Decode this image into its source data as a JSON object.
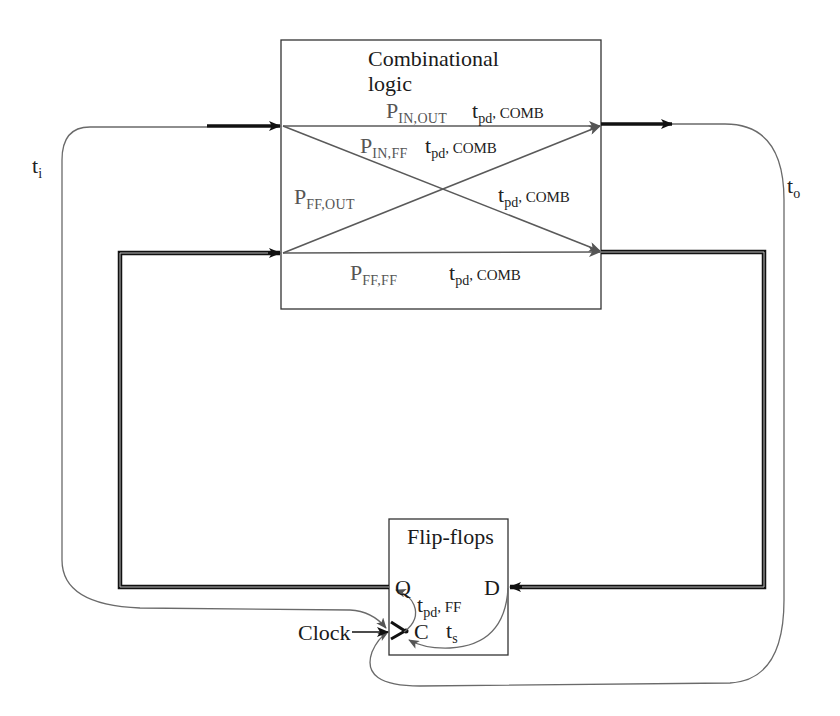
{
  "blocks": {
    "comb": {
      "title_line1": "Combinational",
      "title_line2": "logic"
    },
    "ff": {
      "title": "Flip-flops",
      "pin_q": "Q",
      "pin_d": "D",
      "pin_c": "C"
    }
  },
  "paths": {
    "in_out": {
      "p": "P",
      "p_sub": "IN,OUT",
      "t": "t",
      "t_sub": "pd",
      "t_tail": ", COMB"
    },
    "in_ff": {
      "p": "P",
      "p_sub": "IN,FF",
      "t": "t",
      "t_sub": "pd",
      "t_tail": ", COMB"
    },
    "ff_out": {
      "p": "P",
      "p_sub": "FF,OUT",
      "t": "t",
      "t_sub": "pd",
      "t_tail": ", COMB"
    },
    "ff_ff": {
      "p": "P",
      "p_sub": "FF,FF",
      "t": "t",
      "t_sub": "pd",
      "t_tail": ", COMB"
    }
  },
  "timings": {
    "ti": {
      "t": "t",
      "sub": "i"
    },
    "to": {
      "t": "t",
      "sub": "o"
    },
    "tpd_ff": {
      "t": "t",
      "sub": "pd",
      "tail": ", FF"
    },
    "ts": {
      "t": "t",
      "sub": "s"
    }
  },
  "inputs": {
    "clock": "Clock"
  },
  "colors": {
    "wire": "#1a1a1a",
    "path_line": "#5a5a5a",
    "timing_curve": "#6a6a6a",
    "box": "#333333"
  }
}
